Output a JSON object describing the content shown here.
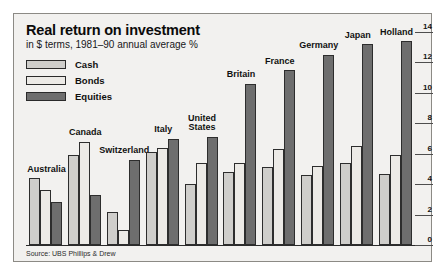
{
  "figure": {
    "title": "Real return on investment",
    "subtitle": "in $ terms, 1981–90 annual average %",
    "source": "Source: UBS Phillips & Drew"
  },
  "legend": {
    "position": "top-left",
    "items": [
      {
        "label": "Cash",
        "color": "#cfcecb",
        "key": "cash"
      },
      {
        "label": "Bonds",
        "color": "#eceae6",
        "key": "bonds"
      },
      {
        "label": "Equities",
        "color": "#6e6e6e",
        "key": "equities"
      }
    ]
  },
  "axis": {
    "y_ticks": [
      "0",
      "2",
      "4",
      "6",
      "8",
      "10",
      "12",
      "14"
    ],
    "y_min": 0,
    "y_max": 14,
    "grid": false,
    "y_axis_side": "right"
  },
  "chart_data": {
    "type": "bar",
    "title": "Real return on investment",
    "subtitle": "in $ terms, 1981–90 annual average %",
    "xlabel": "",
    "ylabel": "",
    "ylim": [
      0,
      14
    ],
    "grid": false,
    "legend_position": "top-left",
    "source": "Source: UBS Phillips & Drew",
    "categories": [
      "Australia",
      "Canada",
      "Switzerland",
      "Italy",
      "United States",
      "Britain",
      "France",
      "Germany",
      "Japan",
      "Holland"
    ],
    "series": [
      {
        "name": "Cash",
        "color": "#cfcecb",
        "values": [
          4.4,
          5.9,
          2.2,
          6.1,
          4.0,
          4.8,
          5.1,
          4.6,
          5.4,
          4.7
        ]
      },
      {
        "name": "Bonds",
        "color": "#eceae6",
        "values": [
          3.6,
          6.8,
          1.0,
          6.4,
          5.4,
          5.4,
          6.3,
          5.2,
          6.5,
          5.9
        ]
      },
      {
        "name": "Equities",
        "color": "#6e6e6e",
        "values": [
          2.8,
          3.3,
          5.6,
          7.0,
          7.1,
          10.6,
          11.5,
          12.5,
          13.2,
          13.4
        ]
      }
    ]
  }
}
